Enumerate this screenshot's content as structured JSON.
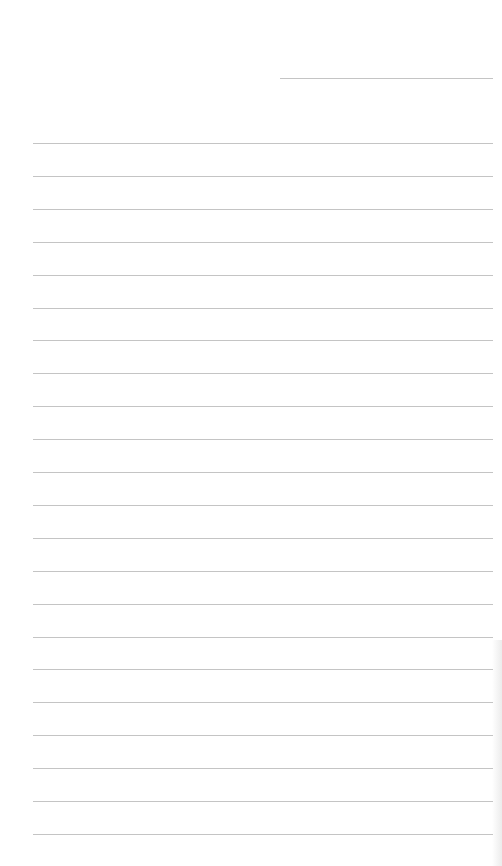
{
  "page": {
    "type": "lined-notebook-page",
    "background_color": "#ffffff",
    "line_color": "#c4c4c4",
    "date_line": {
      "x": 280,
      "y": 78,
      "width": 213
    },
    "rules": {
      "count": 22,
      "start_y": 143,
      "spacing": 32.9,
      "x": 33,
      "width": 460
    }
  }
}
